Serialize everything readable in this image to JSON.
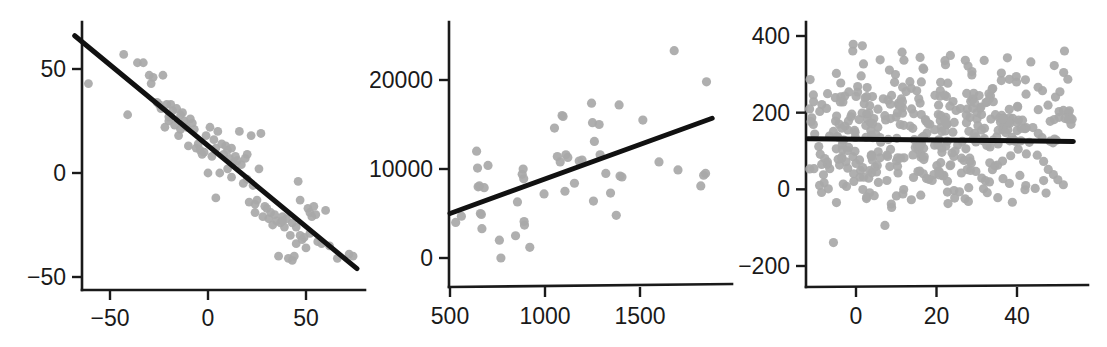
{
  "figure": {
    "background": "#ffffff",
    "point_color": "#a9a9a9",
    "line_color": "#111111",
    "axis_color": "#1a1a1a",
    "panel_count": 3
  },
  "chart_data": [
    {
      "type": "scatter",
      "title": "",
      "xlabel": "",
      "ylabel": "",
      "grid": false,
      "legend": false,
      "xlim": [
        -70,
        80
      ],
      "ylim": [
        -58,
        72
      ],
      "xticks": [
        -50,
        0,
        50
      ],
      "xticklabels": [
        "−50",
        "0",
        "50"
      ],
      "yticks": [
        -50,
        0,
        50
      ],
      "yticklabels": [
        "−50",
        "0",
        "50"
      ],
      "fit_line": {
        "x0": -68,
        "y0": 66,
        "x1": 76,
        "y1": -46
      },
      "points": [
        [
          -61,
          43
        ],
        [
          -43,
          57
        ],
        [
          -41,
          28
        ],
        [
          -36,
          53
        ],
        [
          -33,
          53
        ],
        [
          -30,
          47
        ],
        [
          -29,
          43
        ],
        [
          -28,
          46
        ],
        [
          -26,
          34
        ],
        [
          -25,
          33
        ],
        [
          -24,
          31
        ],
        [
          -23,
          47
        ],
        [
          -22,
          22
        ],
        [
          -21,
          33
        ],
        [
          -20,
          25
        ],
        [
          -19,
          33
        ],
        [
          -18,
          30
        ],
        [
          -17,
          23
        ],
        [
          -16,
          31
        ],
        [
          -15,
          18
        ],
        [
          -14,
          28
        ],
        [
          -13,
          29
        ],
        [
          -12,
          25
        ],
        [
          -11,
          22
        ],
        [
          -10,
          13
        ],
        [
          -9,
          26
        ],
        [
          -8,
          24
        ],
        [
          -7,
          21
        ],
        [
          -6,
          12
        ],
        [
          -5,
          14
        ],
        [
          -4,
          11
        ],
        [
          -3,
          9
        ],
        [
          -2,
          10
        ],
        [
          -1,
          18
        ],
        [
          0,
          0
        ],
        [
          1,
          22
        ],
        [
          2,
          8
        ],
        [
          3,
          16
        ],
        [
          4,
          12
        ],
        [
          4,
          -12
        ],
        [
          5,
          20
        ],
        [
          6,
          0
        ],
        [
          7,
          14
        ],
        [
          8,
          9
        ],
        [
          9,
          13
        ],
        [
          10,
          11
        ],
        [
          11,
          7
        ],
        [
          12,
          12
        ],
        [
          13,
          5
        ],
        [
          14,
          8
        ],
        [
          15,
          6
        ],
        [
          16,
          20
        ],
        [
          17,
          4
        ],
        [
          18,
          -5
        ],
        [
          19,
          7
        ],
        [
          20,
          -3
        ],
        [
          21,
          -14
        ],
        [
          22,
          18
        ],
        [
          23,
          -6
        ],
        [
          24,
          -15
        ],
        [
          25,
          -13
        ],
        [
          26,
          2
        ],
        [
          27,
          19
        ],
        [
          28,
          -21
        ],
        [
          29,
          -16
        ],
        [
          30,
          -17
        ],
        [
          31,
          -22
        ],
        [
          32,
          -19
        ],
        [
          33,
          -25
        ],
        [
          34,
          -20
        ],
        [
          35,
          -23
        ],
        [
          36,
          -40
        ],
        [
          37,
          -24
        ],
        [
          38,
          -21
        ],
        [
          39,
          -26
        ],
        [
          40,
          -22
        ],
        [
          41,
          -41
        ],
        [
          42,
          -30
        ],
        [
          43,
          -42
        ],
        [
          44,
          -40
        ],
        [
          45,
          -34
        ],
        [
          46,
          -4
        ],
        [
          47,
          -13
        ],
        [
          48,
          -32
        ],
        [
          49,
          -31
        ],
        [
          50,
          -36
        ],
        [
          51,
          -17
        ],
        [
          52,
          -19
        ],
        [
          53,
          -21
        ],
        [
          54,
          -16
        ],
        [
          55,
          -20
        ],
        [
          56,
          -33
        ],
        [
          58,
          -34
        ],
        [
          60,
          -18
        ],
        [
          62,
          -35
        ],
        [
          66,
          -41
        ],
        [
          72,
          -39
        ],
        [
          74,
          -40
        ],
        [
          -20,
          27
        ],
        [
          -14,
          21
        ],
        [
          10,
          2
        ],
        [
          12,
          -2
        ],
        [
          20,
          9
        ],
        [
          24,
          -19
        ],
        [
          38,
          -23
        ],
        [
          43,
          -24
        ],
        [
          45,
          -26
        ],
        [
          47,
          -30
        ],
        [
          52,
          -29
        ]
      ]
    },
    {
      "type": "scatter",
      "title": "",
      "xlabel": "",
      "ylabel": "",
      "grid": false,
      "legend": false,
      "xlim": [
        480,
        1890
      ],
      "ylim": [
        -2200,
        25500
      ],
      "xticks": [
        500,
        1000,
        1500
      ],
      "xticklabels": [
        "500",
        "1000",
        "1500"
      ],
      "yticks": [
        0,
        10000,
        20000
      ],
      "yticklabels": [
        "0",
        "10000",
        "20000"
      ],
      "fit_line": {
        "x0": 500,
        "y0": 5000,
        "x1": 1880,
        "y1": 15700
      },
      "points": [
        [
          530,
          4000
        ],
        [
          560,
          4700
        ],
        [
          640,
          12000
        ],
        [
          645,
          10100
        ],
        [
          648,
          8000
        ],
        [
          655,
          8100
        ],
        [
          660,
          5000
        ],
        [
          665,
          4900
        ],
        [
          668,
          3300
        ],
        [
          680,
          7900
        ],
        [
          700,
          10400
        ],
        [
          760,
          2000
        ],
        [
          768,
          0
        ],
        [
          845,
          2500
        ],
        [
          855,
          6300
        ],
        [
          880,
          9400
        ],
        [
          885,
          10000
        ],
        [
          888,
          8900
        ],
        [
          890,
          4100
        ],
        [
          892,
          3700
        ],
        [
          920,
          1200
        ],
        [
          995,
          7200
        ],
        [
          1050,
          14600
        ],
        [
          1065,
          11400
        ],
        [
          1080,
          10800
        ],
        [
          1090,
          16000
        ],
        [
          1095,
          15900
        ],
        [
          1105,
          7500
        ],
        [
          1110,
          11600
        ],
        [
          1120,
          11300
        ],
        [
          1155,
          8400
        ],
        [
          1180,
          10900
        ],
        [
          1195,
          11000
        ],
        [
          1245,
          17400
        ],
        [
          1250,
          15200
        ],
        [
          1255,
          6400
        ],
        [
          1260,
          13100
        ],
        [
          1285,
          15000
        ],
        [
          1290,
          11600
        ],
        [
          1320,
          9500
        ],
        [
          1345,
          7300
        ],
        [
          1375,
          4800
        ],
        [
          1390,
          17200
        ],
        [
          1395,
          9200
        ],
        [
          1405,
          9100
        ],
        [
          1515,
          15500
        ],
        [
          1600,
          10800
        ],
        [
          1680,
          23300
        ],
        [
          1700,
          9900
        ],
        [
          1820,
          8100
        ],
        [
          1835,
          9300
        ],
        [
          1845,
          9500
        ],
        [
          1850,
          19800
        ]
      ]
    },
    {
      "type": "scatter",
      "title": "",
      "xlabel": "",
      "ylabel": "",
      "grid": false,
      "legend": false,
      "xlim": [
        -13,
        55
      ],
      "ylim": [
        -255,
        440
      ],
      "xticks": [
        0,
        20,
        40
      ],
      "xticklabels": [
        "0",
        "20",
        "40"
      ],
      "yticks": [
        -200,
        0,
        200,
        400
      ],
      "yticklabels": [
        "−200",
        "0",
        "200",
        "400"
      ],
      "fit_line": {
        "x0": -12,
        "y0": 132,
        "x1": 54,
        "y1": 125
      },
      "n_points": 430,
      "description": "Dense cloud of grey points, roughly flat relationship; y spread approx -200 to 400, x from -12 to 54; near-horizontal fit line at about y=130.",
      "seed": 20250711
    }
  ]
}
